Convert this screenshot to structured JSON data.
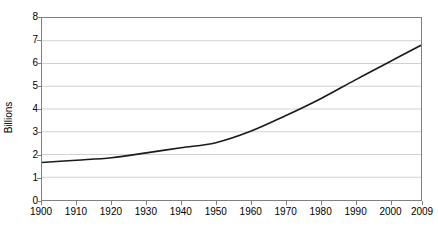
{
  "chart_data": {
    "type": "line",
    "title": "",
    "xlabel": "",
    "ylabel": "Billions",
    "xlim": [
      1900,
      2009
    ],
    "ylim": [
      0,
      8
    ],
    "grid": true,
    "legend": false,
    "y_ticks": [
      8,
      7,
      6,
      5,
      4,
      3,
      2,
      1,
      0
    ],
    "x_ticks": [
      1900,
      1910,
      1920,
      1930,
      1940,
      1950,
      1960,
      1970,
      1980,
      1990,
      2000,
      2009
    ],
    "series": [
      {
        "name": "World population",
        "x": [
          1900,
          1910,
          1920,
          1930,
          1940,
          1950,
          1960,
          1970,
          1980,
          1990,
          2000,
          2009
        ],
        "values": [
          1.65,
          1.75,
          1.86,
          2.07,
          2.3,
          2.52,
          3.02,
          3.7,
          4.44,
          5.27,
          6.08,
          6.8
        ]
      }
    ],
    "line_color": "#1a1a1a",
    "grid_color": "#d0d0d0",
    "axis_color": "#808080",
    "background_color": "#ffffff"
  }
}
